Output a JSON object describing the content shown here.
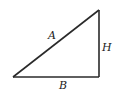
{
  "diagram": {
    "type": "right-triangle",
    "stroke_color": "#2a2a2a",
    "vertices": {
      "left": [
        13,
        77
      ],
      "top_right": [
        99,
        10
      ],
      "bottom_right": [
        99,
        77
      ]
    },
    "labels": {
      "hypotenuse": "A",
      "vertical_side": "H",
      "base": "B"
    }
  }
}
